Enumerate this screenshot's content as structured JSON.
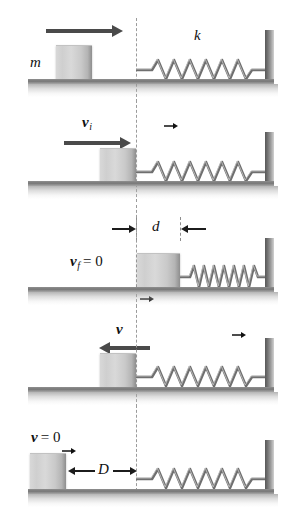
{
  "figure": {
    "type": "physics-diagram",
    "background_color": "#ffffff",
    "line_color": "#4a4a4a",
    "block_color": "#d0d0d0",
    "wall_color": "#7a7a7a",
    "spring_color": "#6f6f6f",
    "dashline_color": "#9b9b9b"
  },
  "panels": [
    {
      "id": "panel-1",
      "stage": "approach",
      "block_label": "m",
      "spring_label": "k",
      "velocity_label": null,
      "velocity_direction": "right",
      "spring_state": "relaxed",
      "block_at": "left-of-line",
      "dimension_label": null
    },
    {
      "id": "panel-2",
      "stage": "contact",
      "block_label": null,
      "spring_label": null,
      "velocity_symbol": "v",
      "velocity_subscript": "i",
      "velocity_suffix": null,
      "velocity_direction": "right",
      "spring_state": "relaxed",
      "block_at": "at-line",
      "dimension_label": null
    },
    {
      "id": "panel-3",
      "stage": "maximum-compression",
      "block_label": null,
      "spring_label": null,
      "velocity_symbol": "v",
      "velocity_subscript": "f",
      "velocity_suffix": "= 0",
      "velocity_direction": "none",
      "spring_state": "compressed",
      "block_at": "right-of-line",
      "dimension_label": "d"
    },
    {
      "id": "panel-4",
      "stage": "rebound",
      "block_label": null,
      "spring_label": null,
      "velocity_symbol": "v",
      "velocity_subscript": null,
      "velocity_suffix": null,
      "velocity_direction": "left",
      "spring_state": "relaxed",
      "block_at": "at-line",
      "dimension_label": null
    },
    {
      "id": "panel-5",
      "stage": "final-rest",
      "block_label": null,
      "spring_label": null,
      "velocity_symbol": "v",
      "velocity_subscript": null,
      "velocity_suffix": "= 0",
      "velocity_direction": "none",
      "spring_state": "relaxed",
      "block_at": "far-left",
      "dimension_label": "D"
    }
  ]
}
